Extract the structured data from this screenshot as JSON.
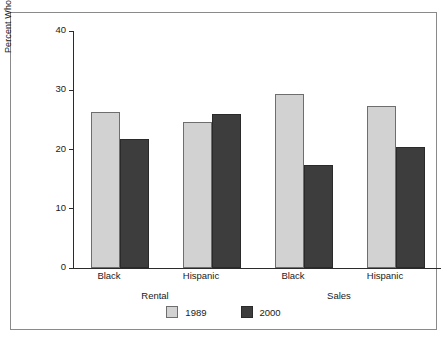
{
  "chart_data": {
    "type": "bar",
    "title": "",
    "subtitle": "",
    "xlabel": "",
    "ylabel": "Percent Who Encountered Discrimination (%)",
    "ylim": [
      0,
      40
    ],
    "ytick_labels": [
      "0",
      "10",
      "20",
      "30",
      "40"
    ],
    "ytick_values": [
      0,
      10,
      20,
      30,
      40
    ],
    "grid": false,
    "legend_position": "bottom-center",
    "categories": [
      "Black",
      "Hispanic",
      "Black",
      "Hispanic"
    ],
    "group_labels": [
      "Rental",
      "Sales"
    ],
    "groups": [
      {
        "name": "Rental",
        "categories": [
          "Black",
          "Hispanic"
        ]
      },
      {
        "name": "Sales",
        "categories": [
          "Black",
          "Hispanic"
        ]
      }
    ],
    "series": [
      {
        "name": "1989",
        "color": "#d2d2d2",
        "values": [
          26.4,
          24.7,
          29.4,
          27.3
        ]
      },
      {
        "name": "2000",
        "color": "#3d3d3d",
        "values": [
          21.7,
          26.0,
          17.4,
          20.4
        ]
      }
    ]
  },
  "legend": {
    "entries": [
      {
        "label": "1989"
      },
      {
        "label": "2000"
      }
    ]
  },
  "colors": {
    "series_1989": "#d2d2d2",
    "series_2000": "#3d3d3d",
    "axis": "#2b2b2b",
    "frame": "#8a8a8a",
    "background": "#ffffff",
    "text": "#1a1a1a"
  }
}
